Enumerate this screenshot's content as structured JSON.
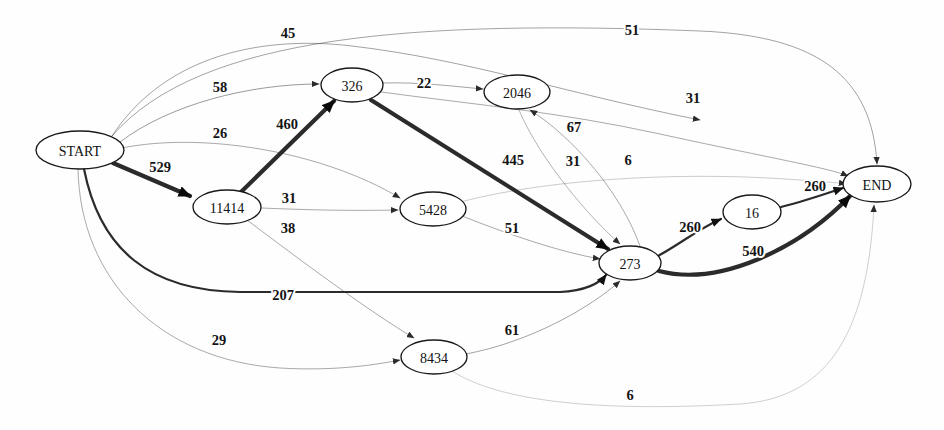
{
  "diagram": {
    "type": "directed-graph",
    "background_color": "#fefefe",
    "node_fill": "#ffffff",
    "node_stroke": "#1a1a1a",
    "edge_color": "#2b2b2b",
    "label_color": "#141414"
  },
  "nodes": [
    {
      "id": "START",
      "label": "START",
      "cx": 80,
      "cy": 150,
      "rx": 44,
      "ry": 19
    },
    {
      "id": "11414",
      "label": "11414",
      "cx": 227,
      "cy": 207,
      "rx": 34,
      "ry": 17
    },
    {
      "id": "326",
      "label": "326",
      "cx": 352,
      "cy": 85,
      "rx": 31,
      "ry": 17
    },
    {
      "id": "2046",
      "label": "2046",
      "cx": 517,
      "cy": 92,
      "rx": 33,
      "ry": 17
    },
    {
      "id": "5428",
      "label": "5428",
      "cx": 433,
      "cy": 209,
      "rx": 33,
      "ry": 17
    },
    {
      "id": "273",
      "label": "273",
      "cx": 630,
      "cy": 263,
      "rx": 31,
      "ry": 17
    },
    {
      "id": "8434",
      "label": "8434",
      "cx": 434,
      "cy": 357,
      "rx": 33,
      "ry": 17
    },
    {
      "id": "16",
      "label": "16",
      "cx": 752,
      "cy": 212,
      "rx": 29,
      "ry": 17
    },
    {
      "id": "END",
      "label": "END",
      "cx": 877,
      "cy": 184,
      "rx": 34,
      "ry": 18
    }
  ],
  "edges": [
    {
      "id": "start-326-45",
      "from": "START",
      "to": "326",
      "weight": 45,
      "label": "45",
      "lx": 288,
      "ly": 33,
      "thickness": 0.8,
      "opacity": 0.55,
      "path": "M 112,136 C 160,62 250,34 352,46 C 470,60 560,92 700,120"
    },
    {
      "id": "start-end-51",
      "from": "START",
      "to": "END",
      "weight": 51,
      "label": "51",
      "lx": 632,
      "ly": 30,
      "thickness": 0.8,
      "opacity": 0.55,
      "path": "M 112,136 C 200,34 420,20 700,31 C 820,36 872,78 877,164"
    },
    {
      "id": "start-326-58",
      "from": "START",
      "to": "326",
      "weight": 58,
      "label": "58",
      "lx": 220,
      "ly": 87,
      "thickness": 0.8,
      "opacity": 0.6,
      "path": "M 120,142 C 170,104 250,84 319,84"
    },
    {
      "id": "start-5428-26",
      "from": "START",
      "to": "5428",
      "weight": 26,
      "label": "26",
      "lx": 220,
      "ly": 133,
      "thickness": 0.8,
      "opacity": 0.5,
      "path": "M 122,148 C 200,132 320,150 400,198"
    },
    {
      "id": "start-11414-529",
      "from": "START",
      "to": "11414",
      "weight": 529,
      "label": "529",
      "lx": 160,
      "ly": 167,
      "thickness": 4.2,
      "opacity": 1,
      "path": "M 113,163 L 190,196"
    },
    {
      "id": "start-273-207",
      "from": "START",
      "to": "273",
      "weight": 207,
      "label": "207",
      "lx": 283,
      "ly": 295,
      "thickness": 2.2,
      "opacity": 1,
      "path": "M 84,169 C 100,250 150,291 240,292 L 560,292 C 585,291 600,283 606,275"
    },
    {
      "id": "start-8434-29",
      "from": "START",
      "to": "8434",
      "weight": 29,
      "label": "29",
      "lx": 219,
      "ly": 340,
      "thickness": 0.8,
      "opacity": 0.5,
      "path": "M 78,169 C 80,280 160,360 280,368 C 330,371 370,366 400,360"
    },
    {
      "id": "n11414-326-460",
      "from": "11414",
      "to": "326",
      "weight": 460,
      "label": "460",
      "lx": 287,
      "ly": 124,
      "thickness": 4.2,
      "opacity": 1,
      "path": "M 241,192 L 334,101"
    },
    {
      "id": "n11414-5428-31",
      "from": "11414",
      "to": "5428",
      "weight": 31,
      "label": "31",
      "lx": 289,
      "ly": 198,
      "thickness": 0.8,
      "opacity": 0.5,
      "path": "M 261,208 C 310,210 350,211 398,210"
    },
    {
      "id": "n11414-8434-38",
      "from": "11414",
      "to": "8434",
      "weight": 38,
      "label": "38",
      "lx": 288,
      "ly": 228,
      "thickness": 0.8,
      "opacity": 0.5,
      "path": "M 247,220 C 300,260 370,312 414,338"
    },
    {
      "id": "n326-2046-22",
      "from": "326",
      "to": "2046",
      "weight": 22,
      "label": "22",
      "lx": 424,
      "ly": 83,
      "thickness": 0.8,
      "opacity": 0.55,
      "path": "M 383,83 C 420,82 450,86 483,89"
    },
    {
      "id": "n326-end-31",
      "from": "326",
      "to": "END",
      "weight": 31,
      "label": "31",
      "lx": 693,
      "ly": 98,
      "thickness": 0.8,
      "opacity": 0.5,
      "path": "M 381,92 C 470,104 560,112 660,134 C 760,156 830,168 848,176"
    },
    {
      "id": "n326-273-445",
      "from": "326",
      "to": "273",
      "weight": 445,
      "label": "445",
      "lx": 513,
      "ly": 160,
      "thickness": 4.2,
      "opacity": 1,
      "path": "M 371,100 L 608,249"
    },
    {
      "id": "n2046-273-31",
      "from": "2046",
      "to": "273",
      "weight": 31,
      "label": "31",
      "lx": 573,
      "ly": 161,
      "thickness": 0.8,
      "opacity": 0.45,
      "path": "M 519,110 C 540,160 590,218 620,244"
    },
    {
      "id": "n273-2046-67",
      "from": "273",
      "to": "2046",
      "weight": 67,
      "label": "67",
      "lx": 574,
      "ly": 127,
      "thickness": 0.8,
      "opacity": 0.5,
      "path": "M 640,246 C 620,190 570,135 530,110"
    },
    {
      "id": "n5428-273-51",
      "from": "5428",
      "to": "273",
      "weight": 51,
      "label": "51",
      "lx": 512,
      "ly": 228,
      "thickness": 0.8,
      "opacity": 0.5,
      "path": "M 462,216 C 510,235 560,252 600,259"
    },
    {
      "id": "n5428-end-6",
      "from": "5428",
      "to": "END",
      "weight": 6,
      "label": "6",
      "lx": 628,
      "ly": 160,
      "thickness": 0.8,
      "opacity": 0.3,
      "path": "M 460,202 C 560,176 700,172 800,180 C 828,182 840,183 846,184"
    },
    {
      "id": "n8434-273-61",
      "from": "8434",
      "to": "273",
      "weight": 61,
      "label": "61",
      "lx": 512,
      "ly": 330,
      "thickness": 0.8,
      "opacity": 0.55,
      "path": "M 466,354 C 530,342 590,308 620,281"
    },
    {
      "id": "n8434-end-6",
      "from": "8434",
      "to": "END",
      "weight": 6,
      "label": "6",
      "lx": 630,
      "ly": 395,
      "thickness": 0.8,
      "opacity": 0.28,
      "path": "M 452,371 C 500,402 600,412 740,404 C 830,398 868,330 874,205"
    },
    {
      "id": "n273-16-260",
      "from": "273",
      "to": "16",
      "weight": 260,
      "label": "260",
      "lx": 690,
      "ly": 227,
      "thickness": 2.2,
      "opacity": 1,
      "path": "M 658,256 C 680,244 700,228 721,219"
    },
    {
      "id": "n273-end-540",
      "from": "273",
      "to": "END",
      "weight": 540,
      "label": "540",
      "lx": 753,
      "ly": 251,
      "thickness": 4.2,
      "opacity": 1,
      "path": "M 659,271 C 720,287 800,248 850,196"
    },
    {
      "id": "n16-end-260",
      "from": "16",
      "to": "END",
      "weight": 260,
      "label": "260",
      "lx": 815,
      "ly": 186,
      "thickness": 2.2,
      "opacity": 1,
      "path": "M 781,207 C 805,201 825,194 843,188"
    }
  ]
}
